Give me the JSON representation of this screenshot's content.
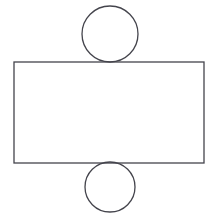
{
  "canvas": {
    "width": 217,
    "height": 223,
    "background_color": "#ffffff"
  },
  "figure": {
    "stroke_color": "#44444c",
    "fill_color": "none",
    "shape_count": 3
  },
  "shapes": {
    "rectangle": {
      "name": "rectangle",
      "x": 14,
      "y": 62,
      "width": 190,
      "height": 101,
      "stroke_color": "#44444c",
      "stroke_width": 1.3,
      "fill": "none"
    },
    "circle_top": {
      "name": "top-circle",
      "cx": 110,
      "cy": 34,
      "r": 28,
      "stroke_color": "#44444c",
      "stroke_width": 1.3,
      "fill": "none"
    },
    "circle_bottom": {
      "name": "bottom-circle",
      "cx": 110,
      "cy": 187,
      "r": 25,
      "stroke_color": "#44444c",
      "stroke_width": 1.3,
      "fill": "none"
    }
  }
}
